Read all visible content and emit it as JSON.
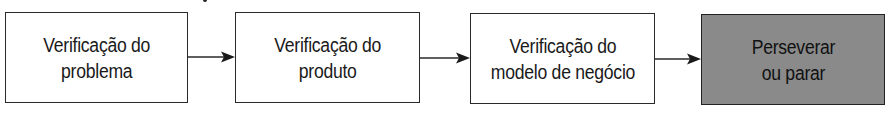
{
  "diagram": {
    "type": "flowchart",
    "direction": "left-to-right",
    "steps": [
      {
        "label": "Verificação do\nproblema",
        "fill": "#ffffff"
      },
      {
        "label": "Verificação do\nproduto",
        "fill": "#ffffff"
      },
      {
        "label": "Verificação do\nmodelo de negócio",
        "fill": "#ffffff"
      },
      {
        "label": "Perseverar\nou parar",
        "fill": "#8a8a8a"
      }
    ],
    "connectors": [
      {
        "from": 0,
        "to": 1
      },
      {
        "from": 1,
        "to": 2
      },
      {
        "from": 2,
        "to": 3
      }
    ],
    "colors": {
      "stroke": "#2a2a2a",
      "text": "#1a1a1a",
      "final_fill": "#8a8a8a"
    }
  }
}
